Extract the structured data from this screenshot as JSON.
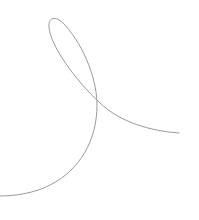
{
  "canvas": {
    "width": 199,
    "height": 220,
    "background": "#ffffff"
  },
  "curve": {
    "shape": "self-intersecting loop stroke",
    "stroke_color": "#9a9a9a",
    "stroke_width": 1,
    "path": "M 179 133 C 150 131, 120 122, 100 103 C 75 80, 50 45, 49 27 C 48 17, 56 16, 63 23 C 80 40, 97 75, 97 105 C 97 140, 80 170, 50 185 C 35 193, 15 196, 0 196"
  }
}
